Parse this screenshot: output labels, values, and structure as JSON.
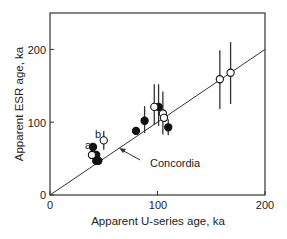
{
  "chart_data": {
    "type": "scatter",
    "title": "",
    "xlabel": "Apparent U-series age, ka",
    "ylabel": "Apparent ESR age, ka",
    "xlim": [
      0,
      200
    ],
    "ylim": [
      0,
      250
    ],
    "xticks": [
      0,
      100,
      200
    ],
    "yticks": [
      0,
      100,
      200
    ],
    "grid": false,
    "legend": "none",
    "reference_line": {
      "label": "Concordia",
      "from": [
        0,
        0
      ],
      "to": [
        200,
        200
      ]
    },
    "annotations": [
      {
        "text": "a",
        "x": 36,
        "y": 68
      },
      {
        "text": "b",
        "x": 45,
        "y": 82
      },
      {
        "text": "Concordia",
        "x": 75,
        "y": 48,
        "arrow_to": [
          66,
          66
        ]
      }
    ],
    "series": [
      {
        "name": "filled",
        "marker": "filled-circle",
        "points": [
          {
            "x": 40,
            "y": 66
          },
          {
            "x": 43,
            "y": 55
          },
          {
            "x": 43,
            "y": 47
          },
          {
            "x": 45,
            "y": 47
          },
          {
            "x": 80,
            "y": 88
          },
          {
            "x": 88,
            "y": 102,
            "ymin": 85,
            "ymax": 122
          },
          {
            "x": 101,
            "y": 121,
            "ymin": 95,
            "ymax": 152
          },
          {
            "x": 110,
            "y": 93,
            "ymin": 82,
            "ymax": 104
          }
        ]
      },
      {
        "name": "open",
        "marker": "open-circle",
        "points": [
          {
            "x": 39,
            "y": 55
          },
          {
            "x": 50,
            "y": 75,
            "ymin": 62,
            "ymax": 88
          },
          {
            "x": 97,
            "y": 121,
            "ymin": 96,
            "ymax": 152
          },
          {
            "x": 105,
            "y": 112,
            "ymin": 83,
            "ymax": 142
          },
          {
            "x": 106,
            "y": 106
          },
          {
            "x": 158,
            "y": 159,
            "ymin": 118,
            "ymax": 199
          },
          {
            "x": 168,
            "y": 168,
            "ymin": 125,
            "ymax": 210
          }
        ]
      }
    ]
  },
  "axes": {
    "xlabel": "Apparent U-series age, ka",
    "ylabel": "Apparent ESR age, ka",
    "xtick_labels": [
      "0",
      "100",
      "200"
    ],
    "ytick_labels": [
      "0",
      "100",
      "200"
    ]
  },
  "labels": {
    "a": "a",
    "b": "b",
    "concordia": "Concordia"
  }
}
